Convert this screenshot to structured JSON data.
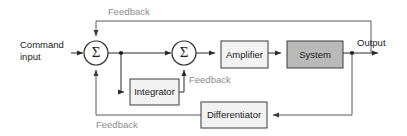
{
  "diagram": {
    "canvas": {
      "width": 407,
      "height": 136,
      "background": "#ffffff"
    },
    "colors": {
      "wire": "#2b2b2b",
      "wire_feedback": "#5a5a5a",
      "block_light_fill": "#f2f2f2",
      "block_dark_fill": "#b9b9b9",
      "block_stroke": "#3a3a3a",
      "text": "#1a1a1a",
      "text_feedback": "#8c8c8c"
    },
    "io": {
      "input_label_line1": "Command",
      "input_label_line2": "input",
      "output_label": "Output"
    },
    "junctions": [
      {
        "id": "sum1",
        "glyph": "Σ",
        "cx": 96,
        "cy": 53,
        "r": 12
      },
      {
        "id": "sum2",
        "glyph": "Σ",
        "cx": 184,
        "cy": 53,
        "r": 12
      }
    ],
    "blocks": [
      {
        "id": "amplifier",
        "label": "Amplifier",
        "x": 221,
        "y": 41,
        "w": 47,
        "h": 27,
        "fill": "light"
      },
      {
        "id": "system",
        "label": "System",
        "x": 287,
        "y": 41,
        "w": 56,
        "h": 27,
        "fill": "dark"
      },
      {
        "id": "integrator",
        "label": "Integrator",
        "x": 130,
        "y": 79,
        "w": 49,
        "h": 26,
        "fill": "light"
      },
      {
        "id": "differentiator",
        "label": "Differentiator",
        "x": 201,
        "y": 102,
        "w": 66,
        "h": 26,
        "fill": "light"
      }
    ],
    "feedback_labels": [
      {
        "id": "feedback-top",
        "text": "Feedback",
        "x": 108,
        "y": 12
      },
      {
        "id": "feedback-middle",
        "text": "Feedback",
        "x": 189,
        "y": 79
      },
      {
        "id": "feedback-bottom",
        "text": "Feedback",
        "x": 96,
        "y": 124
      }
    ],
    "paths": {
      "input_to_sum1": "Command input enters summing junction 1 from the left",
      "sum1_to_sum2": "Output of junction 1 feeds junction 2 and branches to integrator",
      "sum2_to_amplifier": "Junction 2 output drives the amplifier",
      "amplifier_to_system": "Amplifier drives the system",
      "system_to_output": "System output node splits to output and feedback paths",
      "outer_feedback": "Output returns to junction 1 via the top feedback line",
      "differentiator_feedback": "Output feeds the differentiator, which returns to junction 1 via the bottom feedback line",
      "integrator_feedback": "Integrator output returns to junction 2 from below"
    }
  }
}
